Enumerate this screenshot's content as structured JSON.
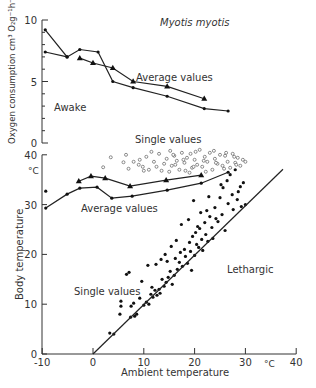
{
  "figure": {
    "title": "Myotis myotis",
    "x_axis_label": "Ambient temperature",
    "x_unit": "°C"
  },
  "chart_data": [
    {
      "type": "line",
      "title": "Myotis myotis",
      "panel": "top",
      "xlabel": "Ambient temperature",
      "ylabel": "Oxygen consumption cm³ O₂g⁻¹h⁻¹",
      "xlim": [
        -10,
        40
      ],
      "ylim": [
        0,
        10
      ],
      "yticks": [
        0,
        5,
        10
      ],
      "annotations": [
        "Awake",
        "Average values"
      ],
      "series": [
        {
          "name": "Average values (dots)",
          "marker": "circle-filled",
          "x": [
            -9.4,
            -5.1,
            -2.6,
            1.0,
            3.9,
            7.9,
            14.6,
            21.9,
            26.6
          ],
          "y": [
            9.2,
            7.0,
            7.6,
            7.4,
            5.0,
            4.5,
            3.8,
            2.8,
            2.6
          ]
        },
        {
          "name": "Average values (dots, lower start)",
          "marker": "circle-filled",
          "x": [
            -9.4,
            -5.1
          ],
          "y": [
            7.4,
            7.0
          ]
        },
        {
          "name": "Average values (triangles)",
          "marker": "triangle-filled",
          "x": [
            -2.6,
            0.0,
            3.9,
            7.9,
            14.6,
            21.9
          ],
          "y": [
            6.9,
            6.5,
            6.1,
            5.0,
            4.6,
            3.6
          ]
        }
      ]
    },
    {
      "type": "scatter",
      "panel": "bottom",
      "xlabel": "Ambient temperature",
      "ylabel": "Body temperature",
      "y_unit": "°C",
      "xlim": [
        -10,
        40
      ],
      "ylim": [
        0,
        40
      ],
      "xticks": [
        -10,
        0,
        10,
        20,
        30,
        40
      ],
      "yticks": [
        0,
        10,
        20,
        30,
        40
      ],
      "annotations": [
        "Single values",
        "Average values",
        "Single values",
        "Lethargic"
      ],
      "series": [
        {
          "name": "Average values (triangles)",
          "kind": "line",
          "marker": "triangle-filled",
          "x": [
            -2.8,
            -0.4,
            2.4,
            7.3,
            14.4,
            21.3
          ],
          "y": [
            34.7,
            35.7,
            35.3,
            33.7,
            34.9,
            35.9
          ]
        },
        {
          "name": "Average values (dots)",
          "kind": "line",
          "marker": "circle-filled",
          "x": [
            -9.3,
            -5.1,
            -2.6,
            0.8,
            3.7,
            7.7,
            14.6,
            21.3,
            26.6
          ],
          "y": [
            29.3,
            32.1,
            33.3,
            33.5,
            31.3,
            31.7,
            32.9,
            34.3,
            36.5
          ]
        },
        {
          "name": "Isolated average point",
          "kind": "point",
          "marker": "circle-filled",
          "x": [
            -9.3
          ],
          "y": [
            32.7
          ]
        },
        {
          "name": "Single values (awake)",
          "kind": "scatter",
          "marker": "circle-open",
          "x": [
            2.0,
            3.5,
            6.0,
            6.5,
            7.0,
            9.0,
            9.2,
            10.0,
            10.5,
            11.5,
            12.0,
            12.5,
            13.0,
            14.0,
            14.5,
            15.0,
            15.2,
            15.5,
            16.0,
            16.5,
            17.0,
            17.5,
            18.0,
            18.5,
            19.0,
            19.2,
            19.5,
            20.0,
            20.5,
            21.0,
            21.5,
            22.0,
            22.5,
            23.0,
            23.5,
            24.0,
            24.5,
            25.0,
            25.5,
            26.0,
            26.5,
            27.0,
            27.5,
            28.0,
            28.5,
            29.0,
            29.5,
            30.0,
            16.2,
            17.8,
            19.8,
            21.8,
            23.8,
            25.8,
            27.8,
            15.8,
            18.2,
            20.2,
            22.2,
            24.2,
            26.2,
            28.2,
            11.0,
            13.5,
            9.8,
            8.0
          ],
          "y": [
            37.5,
            39.5,
            38.5,
            40.0,
            37.2,
            38.0,
            39.0,
            36.8,
            39.6,
            40.6,
            38.6,
            37.6,
            40.2,
            38.2,
            39.2,
            36.6,
            40.8,
            37.8,
            39.8,
            38.8,
            37.0,
            40.4,
            38.4,
            39.4,
            36.4,
            40.2,
            37.4,
            39.0,
            38.0,
            41.0,
            37.6,
            39.6,
            38.6,
            40.4,
            37.0,
            39.2,
            38.2,
            40.0,
            37.8,
            39.8,
            38.6,
            37.4,
            40.2,
            38.4,
            39.4,
            37.8,
            39.0,
            38.6,
            38.0,
            39.0,
            37.6,
            38.8,
            40.8,
            37.2,
            39.6,
            40.0,
            36.8,
            40.6,
            36.6,
            38.4,
            40.4,
            38.0,
            37.0,
            36.8,
            37.6,
            38.6
          ]
        },
        {
          "name": "Single values (lethargic)",
          "kind": "scatter",
          "marker": "circle-filled",
          "x": [
            3.3,
            4.1,
            5.3,
            5.5,
            5.5,
            7.1,
            7.4,
            7.5,
            8.0,
            8.2,
            8.6,
            9.2,
            10.0,
            10.5,
            11.0,
            11.4,
            11.8,
            12.2,
            12.6,
            13.0,
            13.2,
            13.6,
            14.0,
            14.4,
            14.6,
            14.8,
            15.2,
            15.6,
            16.0,
            16.2,
            16.6,
            17.0,
            17.2,
            17.6,
            18.0,
            18.2,
            18.6,
            19.0,
            19.2,
            19.6,
            20.0,
            20.2,
            20.4,
            20.8,
            21.0,
            21.4,
            21.6,
            22.0,
            22.2,
            22.6,
            23.0,
            23.4,
            24.0,
            24.6,
            25.0,
            25.4,
            25.6,
            26.0,
            26.4,
            26.6,
            27.0,
            27.4,
            27.6,
            28.0,
            28.4,
            28.6,
            29.0,
            29.2,
            29.6,
            30.0,
            17.4,
            18.8,
            19.4,
            20.6,
            21.2,
            22.4,
            23.6,
            24.2,
            15.4,
            16.4,
            12.4,
            13.4,
            6.6,
            9.6,
            10.8,
            11.6,
            14.2,
            19.8,
            22.8,
            25.2
          ],
          "y": [
            4.2,
            4.0,
            8.0,
            9.6,
            10.6,
            16.4,
            7.4,
            9.6,
            10.2,
            7.6,
            8.0,
            11.2,
            9.8,
            10.4,
            10.0,
            12.0,
            11.4,
            12.8,
            11.8,
            13.0,
            12.2,
            15.0,
            13.6,
            14.4,
            18.6,
            15.4,
            16.6,
            14.0,
            15.8,
            19.2,
            17.0,
            18.4,
            20.4,
            17.6,
            21.0,
            19.6,
            18.2,
            22.4,
            20.6,
            23.6,
            19.8,
            24.4,
            22.0,
            21.4,
            25.2,
            23.0,
            20.8,
            26.4,
            24.0,
            22.6,
            27.6,
            25.4,
            29.4,
            26.6,
            31.4,
            28.0,
            33.4,
            24.8,
            34.8,
            30.2,
            36.0,
            32.0,
            29.0,
            37.0,
            31.0,
            32.6,
            33.6,
            29.6,
            34.4,
            30.0,
            26.0,
            27.0,
            16.8,
            25.6,
            28.4,
            28.8,
            23.2,
            27.2,
            21.6,
            22.8,
            18.0,
            19.0,
            16.0,
            14.6,
            17.8,
            13.4,
            20.0,
            30.8,
            31.6,
            34.0
          ]
        },
        {
          "name": "Tb = Ta boundary line",
          "kind": "line",
          "marker": "none",
          "x": [
            0,
            37.4
          ],
          "y": [
            0,
            37.1
          ]
        }
      ]
    }
  ],
  "labels": {
    "top_title": "Myotis myotis",
    "top_ylabel": "Oxygen consumption cm³ O₂g⁻¹h⁻¹",
    "awake": "Awake",
    "top_average": "Average values",
    "single_values_top": "Single values",
    "bottom_unit": "°C",
    "bottom_ylabel": "Body temperature",
    "bottom_average": "Average values",
    "single_values_bottom": "Single values",
    "lethargic": "Lethargic",
    "xlabel": "Ambient temperature",
    "x_unit": "°C",
    "top_yticks": [
      "0",
      "5",
      "10"
    ],
    "bottom_yticks": [
      "0",
      "10",
      "20",
      "30",
      "40"
    ],
    "xticks": [
      "-10",
      "0",
      "10",
      "20",
      "30",
      "40"
    ]
  }
}
